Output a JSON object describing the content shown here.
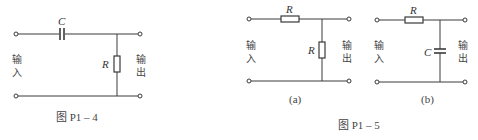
{
  "figures": [
    {
      "id": "P1-4",
      "caption": "图 P1 – 4",
      "components": {
        "series": "C",
        "shunt": "R"
      },
      "input_label": [
        "输",
        "入"
      ],
      "output_label": [
        "输",
        "出"
      ]
    },
    {
      "id": "P1-5",
      "caption": "图 P1 – 5",
      "subfigures": [
        {
          "tag": "(a)",
          "components": {
            "series": "R",
            "shunt": "R"
          },
          "input_label": [
            "输",
            "入"
          ],
          "output_label": [
            "输",
            "出"
          ]
        },
        {
          "tag": "(b)",
          "components": {
            "series": "R",
            "shunt": "C"
          },
          "input_label": [
            "输",
            "入"
          ],
          "output_label": [
            "输",
            "出"
          ]
        }
      ]
    }
  ]
}
